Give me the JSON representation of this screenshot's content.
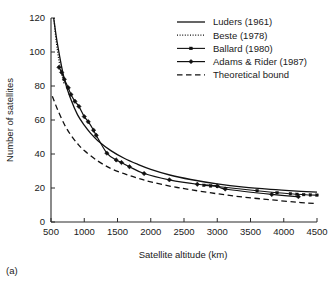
{
  "caption": "(a)",
  "chart_data": {
    "type": "line",
    "title": "",
    "xlabel": "Satellite altitude (km)",
    "ylabel": "Number of satellites",
    "xlim": [
      500,
      4500
    ],
    "ylim": [
      0,
      120
    ],
    "xticks": [
      500,
      1000,
      1500,
      2000,
      2500,
      3000,
      3500,
      4000,
      4500
    ],
    "xticklabels": [
      "500",
      "1000",
      "1500",
      "2000",
      "2500",
      "3000",
      "3500",
      "4000",
      "4500"
    ],
    "yticks": [
      0,
      20,
      40,
      60,
      80,
      100,
      120
    ],
    "yticklabels": [
      "0",
      "20",
      "40",
      "60",
      "80",
      "100",
      "120"
    ],
    "grid": false,
    "legend_position": "upper right",
    "series": [
      {
        "name": "Luders (1961)",
        "style": "solid",
        "marker": "none",
        "x": [
          540,
          600,
          700,
          800,
          900,
          1000,
          1100,
          1200,
          1400,
          1600,
          1800,
          2000,
          2300,
          2600,
          3000,
          3400,
          3800,
          4200,
          4500
        ],
        "y": [
          120,
          104,
          84,
          72,
          63,
          57,
          52,
          48,
          42,
          37.5,
          34,
          31,
          27.5,
          25,
          22.4,
          20.5,
          19.2,
          18.2,
          17.6
        ]
      },
      {
        "name": "Beste (1978)",
        "style": "dotted",
        "marker": "none",
        "x": [
          545,
          560,
          580,
          600,
          620,
          640,
          660,
          680,
          700
        ],
        "y": [
          120,
          113,
          106,
          100,
          95,
          91,
          87,
          84,
          81
        ]
      },
      {
        "name": "Ballard (1980)",
        "style": "solid-small-marker",
        "marker": "square",
        "x": [
          2800,
          2900,
          3000,
          3600,
          3900,
          4100,
          4200,
          4300,
          4400,
          4500
        ],
        "y": [
          21.6,
          21.2,
          20.9,
          18.4,
          17.2,
          16.6,
          16.3,
          16.1,
          15.9,
          15.8
        ]
      },
      {
        "name": "Adams & Rider (1987)",
        "style": "solid-marker",
        "marker": "diamond",
        "x": [
          620,
          660,
          700,
          760,
          800,
          860,
          920,
          1000,
          1060,
          1140,
          1180,
          1340,
          1480,
          1560,
          1680,
          1900,
          2280,
          2700,
          3000,
          3120,
          3820,
          4220
        ],
        "y": [
          91,
          88,
          84,
          79,
          75,
          71,
          68,
          62,
          59,
          54,
          51,
          40.5,
          36.5,
          35,
          32.5,
          28.5,
          24.8,
          22.2,
          21.2,
          19.4,
          16.2,
          14.9
        ]
      },
      {
        "name": "Theoretical bound",
        "style": "dashed",
        "marker": "none",
        "x": [
          520,
          600,
          700,
          800,
          900,
          1000,
          1200,
          1400,
          1600,
          1800,
          2000,
          2300,
          2600,
          3000,
          3400,
          3800,
          4200,
          4500
        ],
        "y": [
          74,
          66,
          57.5,
          51,
          46,
          42,
          36,
          31.5,
          28.4,
          25.8,
          23.6,
          21,
          19,
          16.6,
          14.6,
          13.1,
          11.6,
          10.8
        ]
      }
    ]
  },
  "legend": {
    "items": [
      {
        "label": "Luders (1961)",
        "style": "solid"
      },
      {
        "label": "Beste (1978)",
        "style": "dotted"
      },
      {
        "label": "Ballard (1980)",
        "style": "solid-small-marker"
      },
      {
        "label": "Adams & Rider (1987)",
        "style": "solid-marker"
      },
      {
        "label": "Theoretical bound",
        "style": "dashed"
      }
    ]
  }
}
